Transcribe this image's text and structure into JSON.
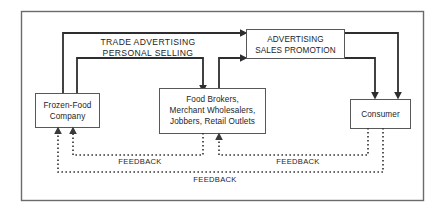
{
  "diagram": {
    "colors": {
      "background": "#ffffff",
      "frame_stroke": "#6b6b6d",
      "box_stroke": "#58585a",
      "flow_line": "#2e2e30",
      "feedback_line": "#3a3a3c",
      "text": "#1d1d1f"
    },
    "boxes": [
      {
        "id": "frozen-food-company",
        "lines": [
          "Frozen-Food",
          "Company"
        ]
      },
      {
        "id": "intermediaries",
        "lines": [
          "Food Brokers,",
          "Merchant Wholesalers,",
          "Jobbers, Retail Outlets"
        ]
      },
      {
        "id": "advertising-sales-promotion",
        "lines": [
          "ADVERTISING",
          "SALES PROMOTION"
        ]
      },
      {
        "id": "consumer",
        "lines": [
          "Consumer"
        ]
      }
    ],
    "flow_labels": {
      "line1": "TRADE ADVERTISING",
      "line2": "PERSONAL SELLING"
    },
    "feedback_labels": {
      "left": "FEEDBACK",
      "right": "FEEDBACK",
      "bottom": "FEEDBACK"
    }
  }
}
